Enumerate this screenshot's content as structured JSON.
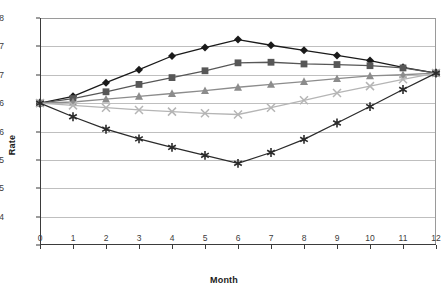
{
  "chart_data": {
    "type": "line",
    "title": "",
    "xlabel": "Month",
    "ylabel": "Rate",
    "x": [
      0,
      1,
      2,
      3,
      4,
      5,
      6,
      7,
      8,
      9,
      10,
      11,
      12
    ],
    "xlim": [
      0,
      12
    ],
    "ylim": [
      4,
      8
    ],
    "xtick_labels": [
      "0",
      "1",
      "2",
      "3",
      "4",
      "5",
      "6",
      "7",
      "8",
      "9",
      "10",
      "11",
      "12"
    ],
    "ytick_values": [
      8,
      7.5,
      7,
      6.5,
      6,
      5.5,
      5,
      4.5,
      4
    ],
    "ytick_labels": [
      "8",
      "7",
      "7",
      "6",
      "6",
      "5",
      "5",
      "4"
    ],
    "grid": true,
    "legend": "none",
    "series": [
      {
        "name": "Series 1",
        "marker": "diamond",
        "color": "#1a1a1a",
        "values": [
          6.5,
          6.62,
          6.86,
          7.09,
          7.33,
          7.48,
          7.62,
          7.52,
          7.43,
          7.34,
          7.25,
          7.13,
          7.03
        ]
      },
      {
        "name": "Series 2",
        "marker": "square",
        "color": "#575757",
        "values": [
          6.5,
          6.58,
          6.7,
          6.83,
          6.95,
          7.07,
          7.21,
          7.22,
          7.19,
          7.18,
          7.16,
          7.12,
          7.03
        ]
      },
      {
        "name": "Series 3",
        "marker": "triangle",
        "color": "#8c8c8c",
        "values": [
          6.5,
          6.52,
          6.57,
          6.62,
          6.67,
          6.72,
          6.78,
          6.83,
          6.88,
          6.93,
          6.98,
          7.0,
          7.03
        ]
      },
      {
        "name": "Series 4",
        "marker": "cross",
        "color": "#b5b5b5",
        "values": [
          6.5,
          6.46,
          6.42,
          6.38,
          6.35,
          6.32,
          6.3,
          6.42,
          6.55,
          6.68,
          6.8,
          6.92,
          7.03
        ]
      },
      {
        "name": "Series 5",
        "marker": "asterisk",
        "color": "#2b2b2b",
        "values": [
          6.5,
          6.26,
          6.04,
          5.87,
          5.72,
          5.58,
          5.44,
          5.63,
          5.86,
          6.15,
          6.44,
          6.74,
          7.03
        ]
      }
    ]
  },
  "axes": {
    "y_title": "Rate",
    "x_title": "Month"
  }
}
